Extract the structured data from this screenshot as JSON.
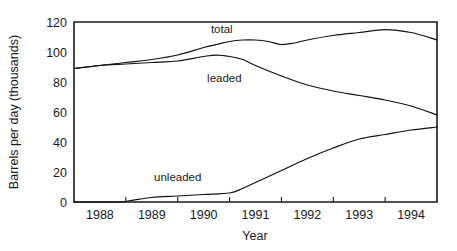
{
  "chart_data": {
    "type": "line",
    "title": "",
    "xlabel": "Year",
    "ylabel": "Barrels per day (thousands)",
    "xlim": [
      1987.5,
      1994.5
    ],
    "ylim": [
      0,
      120
    ],
    "grid": false,
    "legend_position": "inline-annotations",
    "x_tick_labels": [
      "1988",
      "1989",
      "1990",
      "1991",
      "1992",
      "1993",
      "1994"
    ],
    "x_tick_centers": [
      1988,
      1989,
      1990,
      1991,
      1992,
      1993,
      1994
    ],
    "x_tick_boundaries": [
      1988.5,
      1989.5,
      1990.5,
      1991.5,
      1992.5,
      1993.5
    ],
    "y_tick_labels": [
      "0",
      "20",
      "40",
      "60",
      "80",
      "100",
      "120"
    ],
    "y_ticks": [
      0,
      20,
      40,
      60,
      80,
      100,
      120
    ],
    "series": [
      {
        "name": "total",
        "label": "total",
        "label_x": 1990.35,
        "label_y": 113,
        "color": "#111111",
        "x": [
          1987.5,
          1988.0,
          1988.5,
          1989.0,
          1989.5,
          1990.0,
          1990.25,
          1990.5,
          1990.75,
          1991.0,
          1991.25,
          1991.5,
          1991.75,
          1992.0,
          1992.5,
          1993.0,
          1993.5,
          1994.0,
          1994.5
        ],
        "values": [
          89,
          91,
          93,
          95,
          98,
          103,
          105,
          107,
          108,
          108,
          107,
          105,
          106,
          108,
          111,
          113,
          115,
          113,
          108
        ]
      },
      {
        "name": "leaded",
        "label": "leaded",
        "label_x": 1990.4,
        "label_y": 80,
        "color": "#111111",
        "x": [
          1987.5,
          1988.0,
          1988.5,
          1989.0,
          1989.5,
          1990.0,
          1990.25,
          1990.5,
          1990.75,
          1991.0,
          1991.5,
          1992.0,
          1992.5,
          1993.0,
          1993.5,
          1994.0,
          1994.5
        ],
        "values": [
          89,
          91,
          92,
          93,
          94,
          97,
          98,
          97,
          95,
          91,
          84,
          78,
          74,
          71,
          68,
          64,
          58
        ]
      },
      {
        "name": "unleaded",
        "label": "unleaded",
        "label_x": 1989.5,
        "label_y": 14,
        "color": "#111111",
        "x": [
          1987.5,
          1988.0,
          1988.4,
          1988.6,
          1989.0,
          1989.5,
          1990.0,
          1990.5,
          1990.75,
          1991.0,
          1991.5,
          1992.0,
          1992.5,
          1993.0,
          1993.5,
          1994.0,
          1994.5
        ],
        "values": [
          0,
          0,
          0,
          1,
          3,
          4,
          5,
          6,
          9,
          13,
          21,
          29,
          36,
          42,
          45,
          48,
          50
        ]
      }
    ]
  }
}
